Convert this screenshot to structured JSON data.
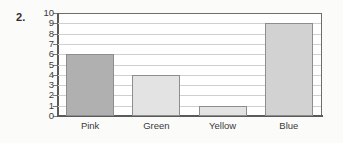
{
  "item_number": "2.",
  "chart_data": {
    "type": "bar",
    "title": "",
    "subtitle": "",
    "xlabel": "",
    "ylabel": "",
    "categories": [
      "Pink",
      "Green",
      "Yellow",
      "Blue"
    ],
    "values": [
      6,
      4,
      1,
      9
    ],
    "series": [
      {
        "name": "",
        "values": [
          6,
          4,
          1,
          9
        ]
      }
    ],
    "ylim": [
      0,
      10
    ],
    "ytick_labels": [
      "10",
      "9",
      "8",
      "7",
      "6",
      "5",
      "4",
      "3",
      "2",
      "1",
      "0"
    ],
    "ytick_values": [
      10,
      9,
      8,
      7,
      6,
      5,
      4,
      3,
      2,
      1,
      0
    ],
    "grid": true,
    "grid_axis": "y",
    "legend": false,
    "legend_position": "none",
    "bar_colors": [
      "#b0b0b0",
      "#e3e3e3",
      "#e3e3e3",
      "#d2d2d2"
    ],
    "bar_border_color": "#8d8d8d",
    "gridline_color": "#cfcfcf",
    "axis_color": "#5a5a5a",
    "plot_background": "#ffffff",
    "page_background": "#fbfbfa"
  }
}
